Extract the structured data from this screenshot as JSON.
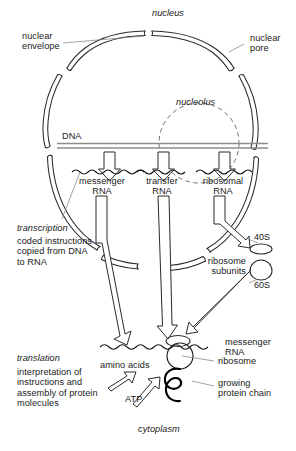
{
  "diagram": {
    "colors": {
      "ink": "#1a1a1a",
      "line": "#2b2b2b",
      "dna": "#8c8c8c",
      "background": "#ffffff",
      "protein_chain": "#000000"
    },
    "labels": {
      "nucleus": "nucleus",
      "nuclear_envelope": "nuclear\nenvelope",
      "nuclear_pore": "nuclear\npore",
      "nucleolus": "nucleolus",
      "dna": "DNA",
      "messenger_rna_nucleus": "messenger\nRNA",
      "transfer_rna": "transfer\nRNA",
      "ribosomal_rna": "ribosomal\nRNA",
      "transcription_title": "transcription",
      "transcription_body": "coded instructions\ncopied from DNA\nto RNA",
      "subunit_40s": "40S",
      "subunit_60s": "60S",
      "ribosome_subunits": "ribosome\nsubunits",
      "translation_title": "translation",
      "translation_body": "interpretation of\ninstructions and\nassembly of protein\nmolecules",
      "amino_acids": "amino acids",
      "atp": "ATP",
      "messenger_rna_cytoplasm": "messenger\nRNA",
      "ribosome": "ribosome",
      "growing_protein_chain": "growing\nprotein chain",
      "cytoplasm": "cytoplasm"
    },
    "icons": {
      "nucleolus": "dashed-circle-icon",
      "dna_strand": "double-line-icon",
      "rna_strand": "wavy-line-icon",
      "transcription_arrow": "hollow-down-arrow-icon",
      "export_arrow": "hollow-channel-arrow-icon",
      "supply_arrow": "hollow-diagonal-arrow-icon",
      "small_subunit": "ellipse-icon",
      "large_subunit": "dome-icon",
      "ribosome": "ribosome-spiral-icon",
      "protein_chain": "coiled-chain-icon"
    }
  }
}
